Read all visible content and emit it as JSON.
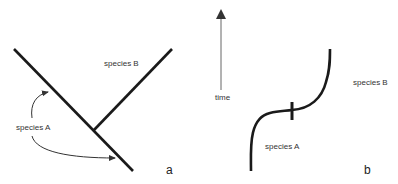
{
  "panel_a": {
    "species_a_label": "species A",
    "species_b_label": "species B",
    "panel_label": "a"
  },
  "panel_b": {
    "time_label": "time",
    "species_a_label": "species A",
    "species_b_label": "species B",
    "panel_label": "b"
  },
  "colors": {
    "line": "#1a1a1a",
    "text": "#333333",
    "time_axis": "#666666"
  }
}
